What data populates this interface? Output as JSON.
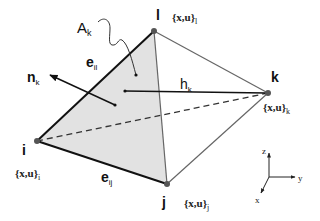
{
  "diagram": {
    "colors": {
      "face_fill": "#e2e2e2",
      "edge_dark": "#111111",
      "edge_gray": "#666666",
      "vertex": "#555555"
    },
    "vertices": {
      "i": {
        "label": "i",
        "data_label": "{x,u}",
        "sub": "i",
        "x": 37,
        "y": 141
      },
      "j": {
        "label": "j",
        "data_label": "{x,u}",
        "sub": "j",
        "x": 167,
        "y": 184
      },
      "k": {
        "label": "k",
        "data_label": "{x,u}",
        "sub": "k",
        "x": 268,
        "y": 93
      },
      "l": {
        "label": "l",
        "data_label": "{x,u}",
        "sub": "l",
        "x": 154,
        "y": 31
      }
    },
    "shaded_face": [
      "i",
      "l",
      "j"
    ],
    "edges": {
      "il": {
        "label": "e",
        "sub": "il"
      },
      "ij": {
        "label": "e",
        "sub": "ij"
      }
    },
    "area": {
      "label": "A",
      "sub": "k"
    },
    "normal": {
      "label": "n",
      "sub": "k"
    },
    "height": {
      "label": "h",
      "sub": "k"
    },
    "axes": {
      "x": "x",
      "y": "y",
      "z": "z"
    }
  }
}
